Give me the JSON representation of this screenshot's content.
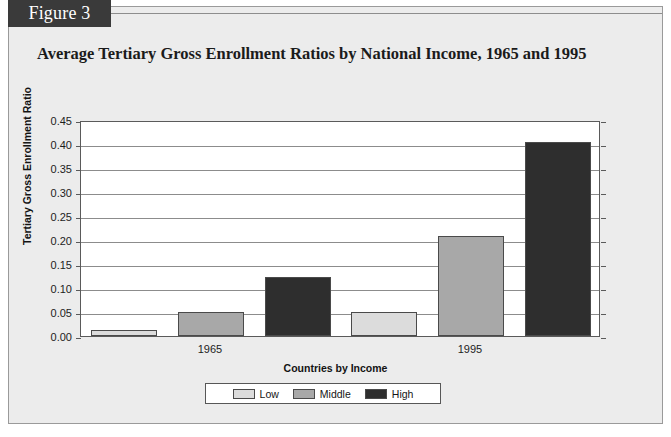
{
  "figure": {
    "badge_label": "Figure 3",
    "title": "Average Tertiary Gross Enrollment Ratios by National Income, 1965 and 1995"
  },
  "colors": {
    "panel_background": "#ececec",
    "badge_background": "#3a3a3a",
    "badge_text": "#ffffff",
    "plot_background": "#ffffff",
    "gridline": "#8c8c8c",
    "axis": "#5a5a5a",
    "series_low": "#dcdcdc",
    "series_middle": "#a8a8a8",
    "series_high": "#2e2e2e"
  },
  "chart_data": {
    "type": "bar",
    "title": "Average Tertiary Gross Enrollment Ratios by National Income, 1965 and 1995",
    "xlabel": "Countries by Income",
    "ylabel": "Tertiary Gross Enrollment Ratio",
    "categories": [
      "1965",
      "1995"
    ],
    "series": [
      {
        "name": "Low",
        "color": "#dcdcdc",
        "values": [
          0.013,
          0.05
        ]
      },
      {
        "name": "Middle",
        "color": "#a8a8a8",
        "values": [
          0.05,
          0.208
        ]
      },
      {
        "name": "High",
        "color": "#2e2e2e",
        "values": [
          0.122,
          0.405
        ]
      }
    ],
    "ylim": [
      0.0,
      0.45
    ],
    "ytick_labels": [
      "0.00",
      "0.05",
      "0.10",
      "0.15",
      "0.20",
      "0.25",
      "0.30",
      "0.35",
      "0.40",
      "0.45"
    ],
    "ytick_values": [
      0.0,
      0.05,
      0.1,
      0.15,
      0.2,
      0.25,
      0.3,
      0.35,
      0.4,
      0.45
    ],
    "grid": true,
    "legend_position": "bottom"
  }
}
